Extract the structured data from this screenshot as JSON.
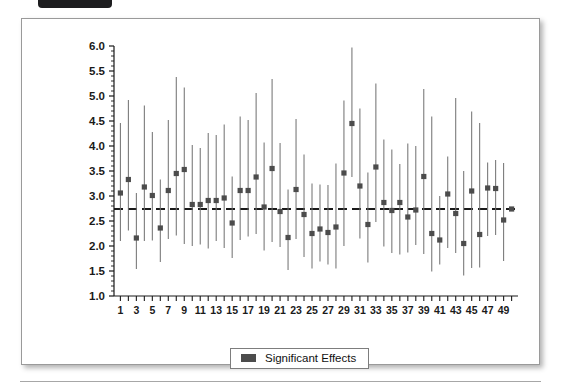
{
  "figure": {
    "background_color": "#ffffff",
    "border_color": "#9a9a9a",
    "top_tab_color": "#1d1d1f"
  },
  "legend": {
    "label": "Significant Effects",
    "swatch_color": "#4c4c4c",
    "position": "bottom-center"
  },
  "chart_data": {
    "type": "scatter",
    "title": "",
    "xlabel": "",
    "ylabel": "",
    "xlim": [
      0.2,
      50.8
    ],
    "ylim": [
      1.0,
      6.0
    ],
    "yticks": [
      1.0,
      1.5,
      2.0,
      2.5,
      3.0,
      3.5,
      4.0,
      4.5,
      5.0,
      5.5,
      6.0
    ],
    "ytick_labels": [
      "1.0",
      "1.5",
      "2.0",
      "2.5",
      "3.0",
      "3.5",
      "4.0",
      "4.5",
      "5.0",
      "5.5",
      "6.0"
    ],
    "xticks": [
      1,
      2,
      3,
      4,
      5,
      6,
      7,
      8,
      9,
      10,
      11,
      12,
      13,
      14,
      15,
      16,
      17,
      18,
      19,
      20,
      21,
      22,
      23,
      24,
      25,
      26,
      27,
      28,
      29,
      30,
      31,
      32,
      33,
      34,
      35,
      36,
      37,
      38,
      39,
      40,
      41,
      42,
      43,
      44,
      45,
      46,
      47,
      48,
      49,
      50
    ],
    "xtick_labels": [
      "1",
      "",
      "3",
      "",
      "5",
      "",
      "7",
      "",
      "9",
      "",
      "11",
      "",
      "13",
      "",
      "15",
      "",
      "17",
      "",
      "19",
      "",
      "21",
      "",
      "23",
      "",
      "25",
      "",
      "27",
      "",
      "29",
      "",
      "31",
      "",
      "33",
      "",
      "35",
      "",
      "37",
      "",
      "39",
      "",
      "41",
      "",
      "43",
      "",
      "45",
      "",
      "47",
      "",
      "49",
      ""
    ],
    "grid": false,
    "marker_color": "#4c4c4c",
    "errorbar_color": "#6e6e6e",
    "reference_line": {
      "value": 2.74,
      "style": "dashed",
      "color": "#1a1a1a"
    },
    "series": [
      {
        "name": "Significant Effects",
        "x": [
          1,
          2,
          3,
          4,
          5,
          6,
          7,
          8,
          9,
          10,
          11,
          12,
          13,
          14,
          15,
          16,
          17,
          18,
          19,
          20,
          21,
          22,
          23,
          24,
          25,
          26,
          27,
          28,
          29,
          30,
          31,
          32,
          33,
          34,
          35,
          36,
          37,
          38,
          39,
          40,
          41,
          42,
          43,
          44,
          45,
          46,
          47,
          48,
          49,
          50
        ],
        "values": [
          3.06,
          3.33,
          2.16,
          3.18,
          3.01,
          2.36,
          3.11,
          3.45,
          3.53,
          2.83,
          2.83,
          2.91,
          2.91,
          2.96,
          2.46,
          3.11,
          3.11,
          3.38,
          2.78,
          3.55,
          2.69,
          2.17,
          3.13,
          2.63,
          2.25,
          2.34,
          2.27,
          2.38,
          3.46,
          4.45,
          3.2,
          2.43,
          3.58,
          2.87,
          2.71,
          2.87,
          2.58,
          2.72,
          3.39,
          2.25,
          2.12,
          3.04,
          2.65,
          2.05,
          3.1,
          2.23,
          3.16,
          3.15,
          2.52,
          2.74
        ],
        "ci_lower": [
          2.1,
          2.31,
          1.54,
          2.1,
          2.11,
          1.68,
          2.14,
          2.21,
          2.04,
          2.0,
          2.03,
          1.95,
          2.1,
          1.96,
          1.76,
          2.12,
          2.19,
          2.24,
          1.91,
          2.08,
          1.98,
          1.52,
          2.14,
          1.78,
          1.55,
          1.69,
          1.63,
          1.55,
          2.0,
          3.38,
          2.15,
          1.67,
          2.48,
          1.99,
          1.86,
          1.83,
          1.87,
          2.02,
          1.84,
          1.49,
          1.63,
          1.96,
          1.86,
          1.41,
          1.56,
          1.57,
          2.2,
          2.22,
          1.7,
          2.7
        ],
        "ci_upper": [
          4.46,
          4.92,
          3.06,
          4.81,
          4.28,
          3.33,
          4.52,
          5.38,
          5.17,
          4.02,
          3.96,
          4.26,
          4.22,
          4.43,
          3.39,
          4.59,
          4.52,
          5.06,
          4.07,
          5.34,
          4.06,
          3.13,
          4.54,
          3.83,
          3.25,
          3.23,
          3.22,
          3.65,
          4.91,
          5.97,
          4.75,
          3.47,
          5.25,
          4.13,
          3.93,
          3.64,
          4.05,
          4.0,
          5.14,
          4.59,
          3.0,
          3.79,
          4.96,
          3.5,
          4.69,
          4.46,
          3.67,
          3.72,
          3.66,
          2.78
        ]
      }
    ]
  }
}
